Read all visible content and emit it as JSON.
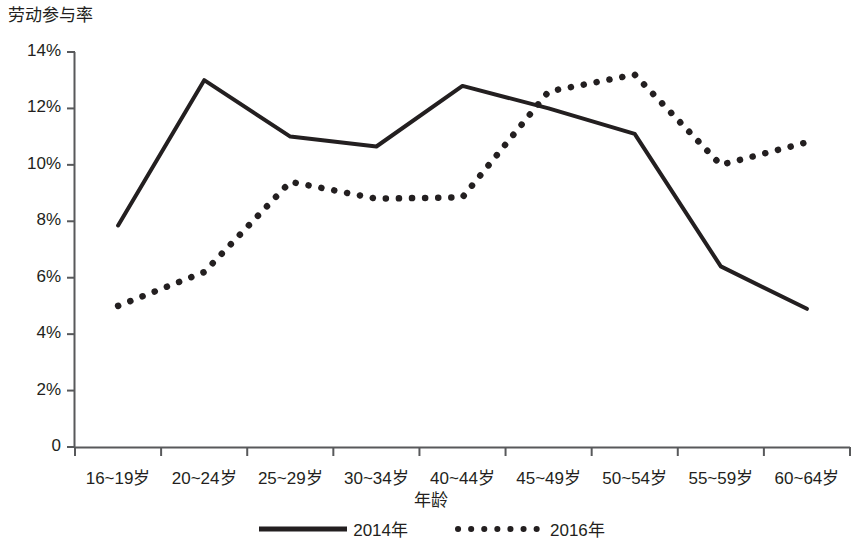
{
  "chart_data": {
    "type": "line",
    "title": "",
    "ylabel": "劳动参与率",
    "xlabel": "年龄",
    "categories": [
      "16~19岁",
      "20~24岁",
      "25~29岁",
      "30~34岁",
      "40~44岁",
      "45~49岁",
      "50~54岁",
      "55~59岁",
      "60~64岁"
    ],
    "ylim": [
      0,
      14
    ],
    "ytick_labels": [
      "14%",
      "12%",
      "10%",
      "8%",
      "6%",
      "4%",
      "2%",
      "0"
    ],
    "ytick_values": [
      14,
      12,
      10,
      8,
      6,
      4,
      2,
      0
    ],
    "grid": false,
    "legend_position": "bottom",
    "series": [
      {
        "name": "2014年",
        "style": "solid",
        "color": "#231f20",
        "values": [
          7.85,
          13.0,
          11.0,
          10.65,
          12.8,
          12.0,
          11.1,
          6.4,
          4.9
        ]
      },
      {
        "name": "2016年",
        "style": "dotted",
        "color": "#231f20",
        "values": [
          5.0,
          6.2,
          9.4,
          8.8,
          8.85,
          12.6,
          13.2,
          10.0,
          10.8
        ]
      }
    ]
  },
  "axis": {
    "y_title": "劳动参与率",
    "x_title": "年龄"
  },
  "legend": {
    "items": [
      {
        "label": "2014年",
        "style": "solid"
      },
      {
        "label": "2016年",
        "style": "dotted"
      }
    ]
  }
}
